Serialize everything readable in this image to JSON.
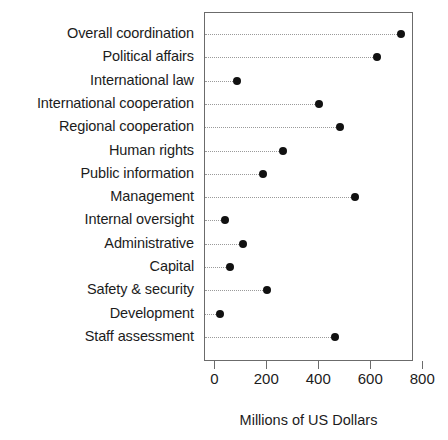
{
  "chart_data": {
    "type": "scatter",
    "subtype": "cleveland-dot-plot",
    "title": "",
    "xlabel": "Millions of US Dollars",
    "ylabel": "",
    "xlim": [
      0,
      800
    ],
    "xticks": [
      0,
      200,
      400,
      600,
      800
    ],
    "xtick_labels": [
      "0",
      "200",
      "400",
      "600",
      "800"
    ],
    "grid": "horizontal-dotted-guides",
    "legend": "none",
    "orientation": "horizontal",
    "categories": [
      "Overall coordination",
      "Political affairs",
      "International law",
      "International cooperation",
      "Regional cooperation",
      "Human rights",
      "Public information",
      "Management",
      "Internal oversight",
      "Administrative",
      "Capital",
      "Safety & security",
      "Development",
      "Staff assessment"
    ],
    "values": [
      715,
      623,
      85,
      400,
      480,
      262,
      185,
      538,
      38,
      107,
      58,
      200,
      18,
      462
    ],
    "points": [
      {
        "category": "Overall coordination",
        "value": 715
      },
      {
        "category": "Political affairs",
        "value": 623
      },
      {
        "category": "International law",
        "value": 85
      },
      {
        "category": "International cooperation",
        "value": 400
      },
      {
        "category": "Regional cooperation",
        "value": 480
      },
      {
        "category": "Human rights",
        "value": 262
      },
      {
        "category": "Public information",
        "value": 185
      },
      {
        "category": "Management",
        "value": 538
      },
      {
        "category": "Internal oversight",
        "value": 38
      },
      {
        "category": "Administrative",
        "value": 107
      },
      {
        "category": "Capital",
        "value": 58
      },
      {
        "category": "Safety & security",
        "value": 200
      },
      {
        "category": "Development",
        "value": 18
      },
      {
        "category": "Staff assessment",
        "value": 462
      }
    ],
    "colors": {
      "dot": "#111111",
      "guide": "#9a9a9a",
      "panel_border": "#6b6b6b",
      "text": "#1c1c1c",
      "background": "#ffffff"
    }
  }
}
